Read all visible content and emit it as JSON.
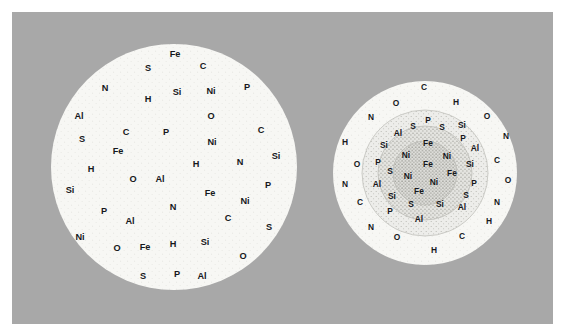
{
  "figure": {
    "panel_background": "#a8a8a8",
    "page_background": "#ffffff",
    "disc_fill": "#f7f7f4",
    "label_color": "#16181c"
  },
  "chart_data": {
    "type": "scatter",
    "title": "",
    "xlabel": "",
    "ylabel": "",
    "legend_position": "none",
    "grid": false,
    "elements_present": [
      "Fe",
      "Ni",
      "Si",
      "S",
      "P",
      "Al",
      "C",
      "N",
      "O",
      "H"
    ],
    "panels": [
      {
        "name": "homogeneous-particle",
        "center_x": 174,
        "center_y": 167,
        "radius": 123,
        "zones": [
          {
            "name": "uniform-body",
            "radius": 123,
            "fill": "#f7f7f4",
            "speckle": "light"
          }
        ],
        "points": [
          {
            "label": "Fe",
            "x": 175,
            "y": 55
          },
          {
            "label": "S",
            "x": 148,
            "y": 69
          },
          {
            "label": "C",
            "x": 203,
            "y": 67
          },
          {
            "label": "N",
            "x": 105,
            "y": 89
          },
          {
            "label": "Si",
            "x": 177,
            "y": 93
          },
          {
            "label": "Ni",
            "x": 211,
            "y": 92
          },
          {
            "label": "P",
            "x": 247,
            "y": 88
          },
          {
            "label": "H",
            "x": 148,
            "y": 100
          },
          {
            "label": "Al",
            "x": 79,
            "y": 117
          },
          {
            "label": "O",
            "x": 211,
            "y": 117
          },
          {
            "label": "C",
            "x": 126,
            "y": 133
          },
          {
            "label": "P",
            "x": 166,
            "y": 133
          },
          {
            "label": "S",
            "x": 82,
            "y": 140
          },
          {
            "label": "C",
            "x": 261,
            "y": 131
          },
          {
            "label": "Ni",
            "x": 212,
            "y": 143
          },
          {
            "label": "Fe",
            "x": 118,
            "y": 152
          },
          {
            "label": "Si",
            "x": 276,
            "y": 157
          },
          {
            "label": "H",
            "x": 91,
            "y": 170
          },
          {
            "label": "H",
            "x": 196,
            "y": 165
          },
          {
            "label": "N",
            "x": 240,
            "y": 163
          },
          {
            "label": "O",
            "x": 133,
            "y": 180
          },
          {
            "label": "Al",
            "x": 160,
            "y": 180
          },
          {
            "label": "Si",
            "x": 70,
            "y": 191
          },
          {
            "label": "P",
            "x": 268,
            "y": 186
          },
          {
            "label": "Fe",
            "x": 210,
            "y": 194
          },
          {
            "label": "N",
            "x": 173,
            "y": 208
          },
          {
            "label": "Ni",
            "x": 245,
            "y": 202
          },
          {
            "label": "P",
            "x": 104,
            "y": 212
          },
          {
            "label": "Al",
            "x": 130,
            "y": 222
          },
          {
            "label": "C",
            "x": 228,
            "y": 219
          },
          {
            "label": "Ni",
            "x": 80,
            "y": 238
          },
          {
            "label": "S",
            "x": 269,
            "y": 228
          },
          {
            "label": "O",
            "x": 117,
            "y": 249
          },
          {
            "label": "Fe",
            "x": 145,
            "y": 248
          },
          {
            "label": "H",
            "x": 173,
            "y": 245
          },
          {
            "label": "Si",
            "x": 205,
            "y": 243
          },
          {
            "label": "O",
            "x": 243,
            "y": 257
          },
          {
            "label": "S",
            "x": 143,
            "y": 277
          },
          {
            "label": "P",
            "x": 177,
            "y": 275
          },
          {
            "label": "Al",
            "x": 202,
            "y": 277
          }
        ]
      },
      {
        "name": "zoned-particle",
        "center_x": 425,
        "center_y": 173,
        "radius": 92,
        "zones": [
          {
            "name": "outer-rim",
            "radius": 92,
            "fill": "#f7f7f4",
            "speckle": "light"
          },
          {
            "name": "mantle-shell",
            "radius": 63,
            "fill": "#dcdcd8",
            "speckle": "medium"
          },
          {
            "name": "inner-shell",
            "radius": 47,
            "fill": "#cfcfcb",
            "speckle": "heavy"
          },
          {
            "name": "metal-core",
            "radius": 32,
            "fill": "#c6c6c2",
            "speckle": "heavy"
          }
        ],
        "points": [
          {
            "label": "C",
            "x": 424,
            "y": 88
          },
          {
            "label": "O",
            "x": 396,
            "y": 104
          },
          {
            "label": "H",
            "x": 456,
            "y": 103
          },
          {
            "label": "N",
            "x": 371,
            "y": 118
          },
          {
            "label": "O",
            "x": 487,
            "y": 117
          },
          {
            "label": "P",
            "x": 428,
            "y": 121
          },
          {
            "label": "S",
            "x": 413,
            "y": 127
          },
          {
            "label": "S",
            "x": 442,
            "y": 128
          },
          {
            "label": "Si",
            "x": 462,
            "y": 126
          },
          {
            "label": "Al",
            "x": 398,
            "y": 134
          },
          {
            "label": "H",
            "x": 345,
            "y": 143
          },
          {
            "label": "N",
            "x": 506,
            "y": 137
          },
          {
            "label": "Si",
            "x": 384,
            "y": 146
          },
          {
            "label": "P",
            "x": 463,
            "y": 139
          },
          {
            "label": "Fe",
            "x": 428,
            "y": 144
          },
          {
            "label": "Al",
            "x": 475,
            "y": 149
          },
          {
            "label": "Ni",
            "x": 406,
            "y": 156
          },
          {
            "label": "Ni",
            "x": 447,
            "y": 157
          },
          {
            "label": "O",
            "x": 357,
            "y": 165
          },
          {
            "label": "P",
            "x": 378,
            "y": 163
          },
          {
            "label": "C",
            "x": 497,
            "y": 161
          },
          {
            "label": "Fe",
            "x": 428,
            "y": 165
          },
          {
            "label": "Si",
            "x": 470,
            "y": 165
          },
          {
            "label": "S",
            "x": 390,
            "y": 172
          },
          {
            "label": "Ni",
            "x": 408,
            "y": 177
          },
          {
            "label": "Fe",
            "x": 452,
            "y": 174
          },
          {
            "label": "N",
            "x": 345,
            "y": 185
          },
          {
            "label": "Al",
            "x": 377,
            "y": 185
          },
          {
            "label": "Ni",
            "x": 434,
            "y": 183
          },
          {
            "label": "P",
            "x": 474,
            "y": 184
          },
          {
            "label": "O",
            "x": 508,
            "y": 181
          },
          {
            "label": "Si",
            "x": 392,
            "y": 197
          },
          {
            "label": "Fe",
            "x": 419,
            "y": 192
          },
          {
            "label": "S",
            "x": 466,
            "y": 196
          },
          {
            "label": "C",
            "x": 360,
            "y": 203
          },
          {
            "label": "N",
            "x": 497,
            "y": 203
          },
          {
            "label": "S",
            "x": 411,
            "y": 205
          },
          {
            "label": "Si",
            "x": 440,
            "y": 205
          },
          {
            "label": "P",
            "x": 390,
            "y": 212
          },
          {
            "label": "Al",
            "x": 462,
            "y": 208
          },
          {
            "label": "Al",
            "x": 419,
            "y": 220
          },
          {
            "label": "H",
            "x": 489,
            "y": 222
          },
          {
            "label": "N",
            "x": 371,
            "y": 228
          },
          {
            "label": "O",
            "x": 397,
            "y": 238
          },
          {
            "label": "C",
            "x": 462,
            "y": 237
          },
          {
            "label": "H",
            "x": 434,
            "y": 251
          }
        ]
      }
    ]
  }
}
